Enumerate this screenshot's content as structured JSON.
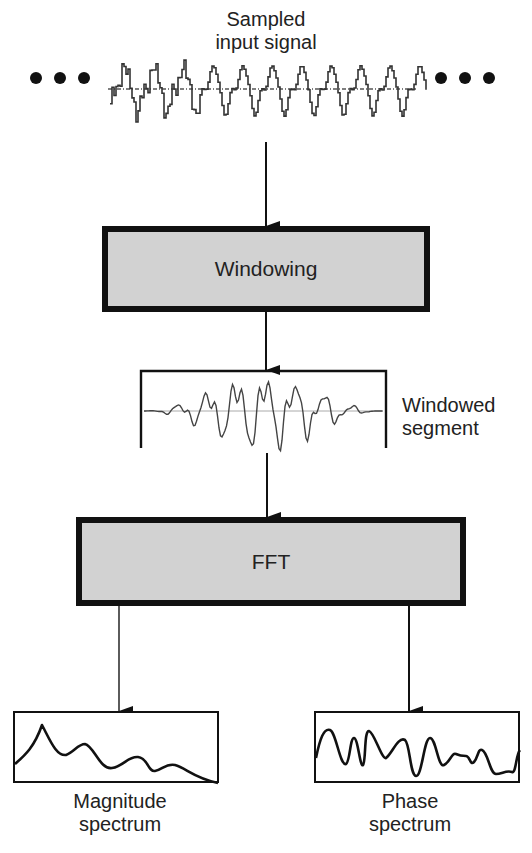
{
  "input": {
    "label_line1": "Sampled",
    "label_line2": "input signal",
    "continuation_left": "•••",
    "continuation_right": "•••"
  },
  "stages": {
    "windowing": {
      "label": "Windowing"
    },
    "windowed_segment": {
      "label_line1": "Windowed",
      "label_line2": "segment"
    },
    "fft": {
      "label": "FFT"
    }
  },
  "outputs": {
    "magnitude": {
      "label_line1": "Magnitude",
      "label_line2": "spectrum"
    },
    "phase": {
      "label_line1": "Phase",
      "label_line2": "spectrum"
    }
  },
  "colors": {
    "box_fill": "#d2d2d2",
    "stroke": "#111111",
    "signal": "#333333",
    "baseline": "#999999"
  }
}
